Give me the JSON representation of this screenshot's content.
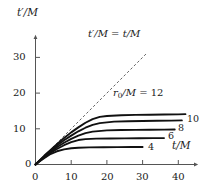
{
  "chart_data": {
    "type": "line",
    "title": "",
    "xlabel": "t/M",
    "ylabel": "t'/M",
    "xlim": [
      0,
      45
    ],
    "ylim": [
      0,
      34
    ],
    "xticks": [
      0,
      10,
      20,
      30,
      40
    ],
    "yticks": [
      0,
      10,
      20,
      30
    ],
    "grid": false,
    "legend_position": "inline-right",
    "annotations": [
      {
        "name": "diagonal-label",
        "text": "t'/M = t/M",
        "x": 18,
        "y": 31
      },
      {
        "name": "family-label",
        "text": "r0/M = 12",
        "x": 27,
        "y": 17
      }
    ],
    "reference_line": {
      "name": "t'/M = t/M",
      "style": "dashed",
      "x": [
        0,
        31
      ],
      "y": [
        0,
        31
      ]
    },
    "series": [
      {
        "name": "r0/M = 12",
        "label": "12",
        "plateau": 14.0,
        "x": [
          0,
          1,
          2.5,
          4,
          6,
          8,
          10,
          12,
          14,
          16,
          18,
          20,
          24,
          28,
          32,
          36,
          40,
          42
        ],
        "y": [
          0,
          1.0,
          2.5,
          3.9,
          5.7,
          7.4,
          9.0,
          10.4,
          11.7,
          12.7,
          13.35,
          13.6,
          13.8,
          13.9,
          13.95,
          14.0,
          14.05,
          14.1
        ]
      },
      {
        "name": "r0/M = 10",
        "label": "10",
        "plateau": 12.3,
        "x": [
          0,
          1,
          2.5,
          4,
          6,
          8,
          10,
          12,
          14,
          16,
          18,
          22,
          26,
          30,
          34,
          38,
          41
        ],
        "y": [
          0,
          0.95,
          2.35,
          3.65,
          5.3,
          6.8,
          8.1,
          9.3,
          10.3,
          11.1,
          11.6,
          12.0,
          12.1,
          12.2,
          12.25,
          12.3,
          12.35
        ]
      },
      {
        "name": "r0/M = 8",
        "label": "8",
        "plateau": 9.8,
        "x": [
          0,
          1,
          2.5,
          4,
          6,
          8,
          10,
          12,
          14,
          16,
          20,
          24,
          28,
          32,
          36,
          39
        ],
        "y": [
          0,
          0.9,
          2.2,
          3.4,
          4.85,
          6.1,
          7.2,
          8.1,
          8.8,
          9.2,
          9.55,
          9.65,
          9.7,
          9.75,
          9.78,
          9.8
        ]
      },
      {
        "name": "r0/M = 6",
        "label": "6",
        "plateau": 7.4,
        "x": [
          0,
          1,
          2.5,
          4,
          6,
          8,
          10,
          12,
          14,
          17,
          21,
          25,
          29,
          33,
          36
        ],
        "y": [
          0,
          0.85,
          2.0,
          3.1,
          4.35,
          5.4,
          6.25,
          6.85,
          7.1,
          7.25,
          7.3,
          7.33,
          7.35,
          7.38,
          7.4
        ]
      },
      {
        "name": "r0/M = 4",
        "label": "4",
        "plateau": 4.9,
        "x": [
          0,
          1,
          2.5,
          4,
          6,
          8,
          10,
          12,
          15,
          19,
          23,
          27,
          30
        ],
        "y": [
          0,
          0.8,
          1.85,
          2.8,
          3.7,
          4.25,
          4.55,
          4.7,
          4.8,
          4.85,
          4.88,
          4.9,
          4.9
        ]
      }
    ]
  },
  "axes": {
    "y_title": "t'/M",
    "x_title": "t/M",
    "x_tick_labels": [
      "0",
      "10",
      "20",
      "30",
      "40"
    ],
    "y_tick_labels": [
      "0",
      "10",
      "20",
      "30"
    ]
  },
  "labels": {
    "diagonal": {
      "lhs": "t'/M",
      "eq": " = ",
      "rhs": "t/M",
      "full": "t'/M = t/M"
    },
    "family": {
      "var": "r",
      "sub": "0",
      "rest": "/M = ",
      "value": "12",
      "full": "r0/M = 12"
    },
    "curve_10": "10",
    "curve_8": "8",
    "curve_6": "6",
    "curve_4": "4"
  },
  "colors": {
    "axis": "#555555",
    "curve": "#111111",
    "dashed": "#666666",
    "text": "#1a1a1a",
    "background": "#ffffff"
  }
}
